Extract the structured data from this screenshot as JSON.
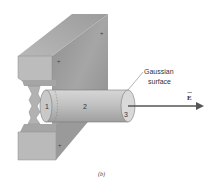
{
  "figure": {
    "caption": "(b)",
    "annotation": "Gaussian surface",
    "annotation_line1": "Gaussian",
    "annotation_line2": "surface",
    "field_label": "E",
    "field_arrow_mark": "→",
    "regions": [
      {
        "id": "1",
        "label": "1"
      },
      {
        "id": "2",
        "label": "2"
      },
      {
        "id": "3",
        "label": "3"
      }
    ],
    "charge_marks": [
      "+",
      "+",
      "+"
    ]
  },
  "colors": {
    "slab_front": "#bdbdbd",
    "slab_top": "#a8a8a8",
    "slab_face": "#9a9a9a",
    "cylinder": "#c4c4c4",
    "cylinder_cap": "#d8d8d8",
    "arrow": "#555555"
  }
}
